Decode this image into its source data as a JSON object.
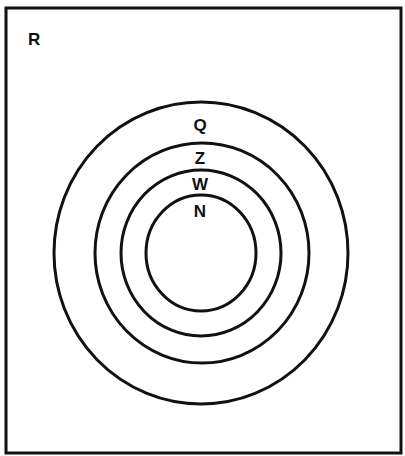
{
  "diagram": {
    "type": "venn-nested-sets",
    "universe": {
      "label": "R"
    },
    "sets": [
      {
        "label": "Q",
        "contains": "Z"
      },
      {
        "label": "Z",
        "contains": "W"
      },
      {
        "label": "W",
        "contains": "N"
      },
      {
        "label": "N",
        "contains": null
      }
    ]
  },
  "colors": {
    "stroke": "#111111",
    "background": "#ffffff"
  }
}
